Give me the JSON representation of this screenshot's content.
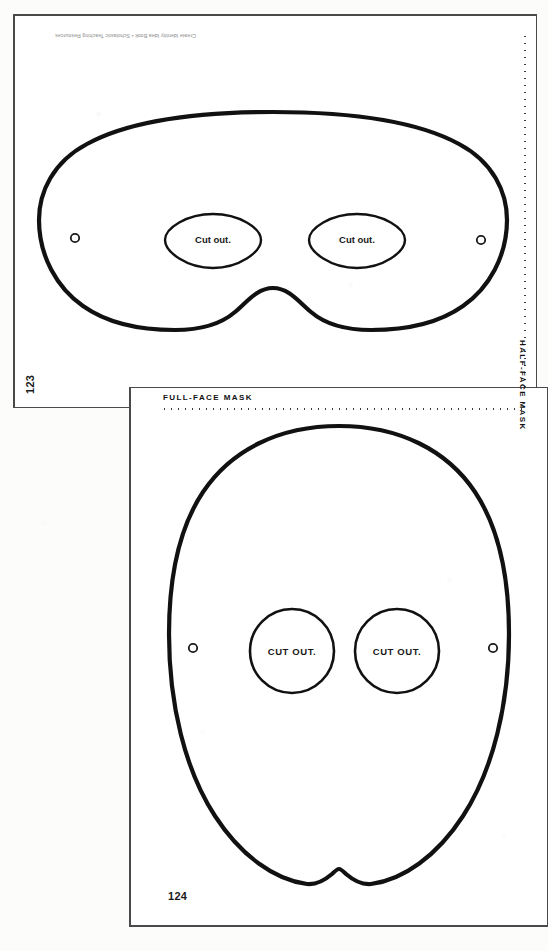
{
  "document": {
    "type": "printable-craft-template-scan",
    "credit_line": "Create Identity Idea Book • Scholastic Teaching Resources"
  },
  "pages": [
    {
      "id": "half-face-mask",
      "page_number": "123",
      "label": "HALF-FACE MASK",
      "label_orientation": "vertical-right-edge",
      "guide_line": "dotted-vertical-right",
      "eye_holes": [
        {
          "position": "left",
          "text": "Cut out.",
          "shape": "almond"
        },
        {
          "position": "right",
          "text": "Cut out.",
          "shape": "almond"
        }
      ],
      "tie_holes": 2,
      "outline_shape": "wide-rounded-domino-mask-with-nose-notch"
    },
    {
      "id": "full-face-mask",
      "page_number": "124",
      "label": "FULL-FACE MASK",
      "label_orientation": "horizontal-top-left",
      "guide_line": "dotted-horizontal-top",
      "eye_holes": [
        {
          "position": "left",
          "text": "CUT OUT.",
          "shape": "circle"
        },
        {
          "position": "right",
          "text": "CUT OUT.",
          "shape": "circle"
        }
      ],
      "tie_holes": 2,
      "outline_shape": "oval-face-with-chin-notch"
    }
  ],
  "colors": {
    "paper": "#ffffff",
    "background": "#fcfcfb",
    "outline_stroke": "#111111",
    "sheet_border": "#4a4a4a",
    "text": "#1a1a1a",
    "credit_text": "#8d8d8d",
    "dots": "#3c3c3c"
  }
}
